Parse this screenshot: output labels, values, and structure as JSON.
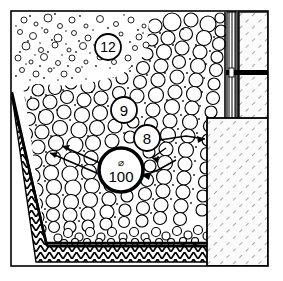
{
  "drawing": {
    "title": "Drainage trench construction detail",
    "type": "cross-section line drawing",
    "background_color": "#ffffff",
    "line_color": "#000000",
    "frame": {
      "x": 11,
      "y": 11,
      "width": 257,
      "height": 255,
      "stroke_width": 1.6
    }
  },
  "callouts": [
    {
      "id": "callout-12",
      "label": "12",
      "cx": 108,
      "cy": 47,
      "r": 13,
      "bold": false,
      "note": "fine sand / filter layer"
    },
    {
      "id": "callout-9",
      "label": "9",
      "cx": 124,
      "cy": 110,
      "r": 13,
      "bold": false,
      "note": "coarse gravel drainage fill"
    },
    {
      "id": "callout-8",
      "label": "8",
      "cx": 147,
      "cy": 138,
      "r": 13,
      "bold": false,
      "note": "gravel layer"
    },
    {
      "id": "callout-100",
      "label": "100",
      "symbol": "⌀",
      "cx": 121,
      "cy": 170,
      "r": 22,
      "bold": true,
      "note": "diameter 100 drain pipe"
    }
  ],
  "layers": [
    {
      "id": "fine-aggregate-zone",
      "name": "Fine sand / small aggregate",
      "pattern": "fine stipple circles"
    },
    {
      "id": "coarse-gravel-zone",
      "name": "Coarse gravel drainage fill",
      "pattern": "packed round aggregate"
    },
    {
      "id": "geotextile-band",
      "name": "Geotextile / compacted fill",
      "pattern": "herringbone chevron hatch"
    },
    {
      "id": "wall-membrane-strip",
      "name": "Drainage membrane strip",
      "pattern": "vertical fine stripes"
    },
    {
      "id": "concrete-wall",
      "name": "Concrete wall",
      "pattern": "diagonal hatch"
    },
    {
      "id": "concrete-slab",
      "name": "Concrete slab / footing",
      "pattern": "diagonal hatch"
    },
    {
      "id": "wall-joint",
      "name": "Horizontal joint / flashing",
      "pattern": "solid black bar"
    }
  ],
  "leader_lines": [
    {
      "id": "leader-100-left-upper",
      "from_callout": "callout-100",
      "direction": "left"
    },
    {
      "id": "leader-100-left-lower",
      "from_callout": "callout-100",
      "direction": "left-down"
    },
    {
      "id": "leader-100-right",
      "from_callout": "callout-100",
      "direction": "right"
    },
    {
      "id": "leader-8-right",
      "from_callout": "callout-8",
      "direction": "right"
    }
  ]
}
